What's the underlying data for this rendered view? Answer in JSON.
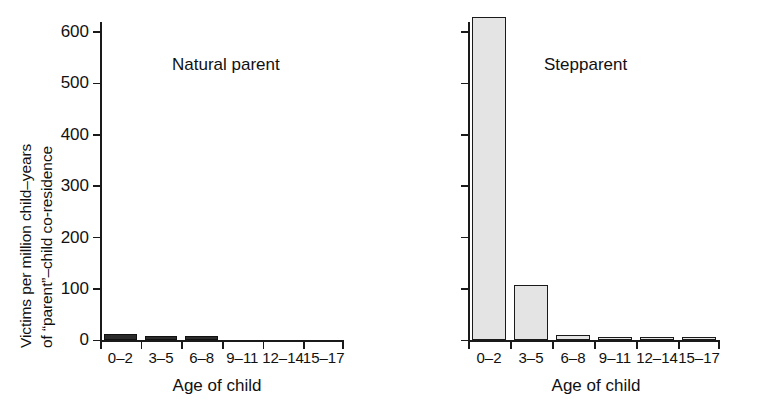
{
  "chart_data": {
    "type": "bar",
    "title": "",
    "xlabel": "Age of child",
    "ylabel_line1": "Victims per million child–years",
    "ylabel_line2": "of “parent”–child co-residence",
    "categories": [
      "0–2",
      "3–5",
      "6–8",
      "9–11",
      "12–14",
      "15–17"
    ],
    "ylim": [
      0,
      600
    ],
    "yticks": [
      0,
      100,
      200,
      300,
      400,
      500,
      600
    ],
    "ytick_labels": [
      "0",
      "100",
      "200",
      "300",
      "400",
      "500",
      "600"
    ],
    "grid": false,
    "legend": "none",
    "panels": [
      {
        "name": "natural-parent",
        "title": "Natural parent",
        "bar_fill": "#2b2b2b",
        "bar_edge": "#111111",
        "values": [
          13,
          9,
          8,
          0,
          0,
          0
        ]
      },
      {
        "name": "stepparent",
        "title": "Stepparent",
        "bar_fill": "#e4e4e4",
        "bar_edge": "#1a1a1a",
        "values": [
          630,
          108,
          10,
          6,
          5,
          4
        ]
      }
    ]
  },
  "axis": {
    "xlabel": "Age of child",
    "ylabel_line1": "Victims per million child–years",
    "ylabel_line2": "of “parent”–child co-residence"
  },
  "panel_left": {
    "title": "Natural parent",
    "xlabel": "Age of child"
  },
  "panel_right": {
    "title": "Stepparent",
    "xlabel": "Age of child"
  }
}
